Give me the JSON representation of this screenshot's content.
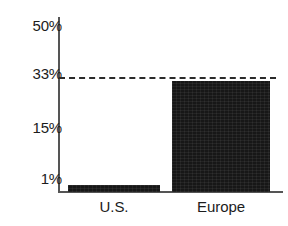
{
  "chart_data": {
    "type": "bar",
    "title": "",
    "subtitle": "",
    "xlabel": "",
    "ylabel": "",
    "categories": [
      "U.S.",
      "Europe"
    ],
    "values": [
      1,
      30
    ],
    "value_unit": "%",
    "ylim": [
      0,
      50
    ],
    "yticks": [
      1,
      15,
      33,
      50
    ],
    "ytick_labels": [
      "1%",
      "15%",
      "33%",
      "50%"
    ],
    "grid": false,
    "legend": null,
    "legend_position": "none",
    "bar_color": "#171717",
    "axis_color": "#555555",
    "text_color": "#1c1c1c",
    "annotations": [
      {
        "type": "reference-line",
        "style": "dashed",
        "value": 33,
        "label": "",
        "color": "#2a2a2a"
      }
    ]
  },
  "axis": {
    "y": {
      "ticks": [
        {
          "label": "50%",
          "value": 50
        },
        {
          "label": "33%",
          "value": 33
        },
        {
          "label": "15%",
          "value": 15
        },
        {
          "label": "1%",
          "value": 1
        }
      ]
    },
    "x": {
      "ticks": [
        {
          "label": "U.S."
        },
        {
          "label": "Europe"
        }
      ]
    }
  },
  "bars": [
    {
      "category": "U.S.",
      "value": 1,
      "display": "1%"
    },
    {
      "category": "Europe",
      "value": 30,
      "display": "30%"
    }
  ]
}
